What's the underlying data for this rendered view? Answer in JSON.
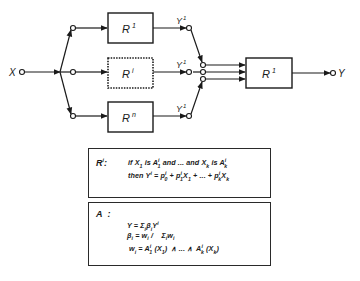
{
  "diagram": {
    "input_label": "X",
    "output_label": "Y",
    "rule_blocks": [
      {
        "id": "rule-1",
        "label": "R",
        "superscript": "1",
        "style": "solid"
      },
      {
        "id": "rule-i",
        "label": "R",
        "superscript": "i",
        "style": "dashed"
      },
      {
        "id": "rule-n",
        "label": "R",
        "superscript": "n",
        "style": "solid"
      }
    ],
    "rule_outputs": [
      {
        "label": "Y",
        "superscript": "1"
      },
      {
        "label": "Y",
        "superscript": "1"
      },
      {
        "label": "Y",
        "superscript": "1"
      }
    ],
    "aggregator": {
      "label": "R",
      "superscript": "1"
    },
    "colors": {
      "stroke": "#1a1a1a",
      "background": "#ffffff"
    }
  },
  "rule_definition": {
    "label": "R",
    "label_superscript": "i",
    "label_suffix": ":",
    "line1": {
      "p1": "if X",
      "s1": "1",
      "p2": " is A",
      "sup2": "i",
      "sub2": "1",
      "p3": " and ... and X",
      "s3": "k",
      "p4": " is A",
      "sup4": "i",
      "sub4": "k"
    },
    "line2": {
      "p1": "then  Y",
      "sup1": "i",
      "p2": " = p",
      "sup2": "i",
      "sub2": "0",
      "p3": " + p",
      "sup3": "i",
      "sub3": "1",
      "p4": "X",
      "sub4": "1",
      "p5": " + ... + p",
      "sup5": "i",
      "sub5": "k",
      "p6": "X",
      "sub6": "k"
    }
  },
  "aggregation_definition": {
    "label": "A",
    "label_suffix": ":",
    "line1": {
      "p1": "Y = Σ",
      "sub1": "i",
      "p2": "β",
      "sub2": "i",
      "p3": "Y",
      "sup3": "i"
    },
    "line2": {
      "p1": "β",
      "sub1": "i",
      "p2": " = w",
      "sub2": "i",
      "p3": " /    Σ",
      "sub3": "i",
      "p4": "w",
      "sub4": "i"
    },
    "line3": {
      "p1": "w",
      "sub1": "i",
      "p2": " = A",
      "sup2": "i",
      "sub2": "1",
      "p3": " (X",
      "sub3": "1",
      "p4": ")  ∧ ... ∧  A",
      "sup4": "i",
      "sub4": "k",
      "p5": " (X",
      "sub5": "k",
      "p6": ")"
    }
  }
}
